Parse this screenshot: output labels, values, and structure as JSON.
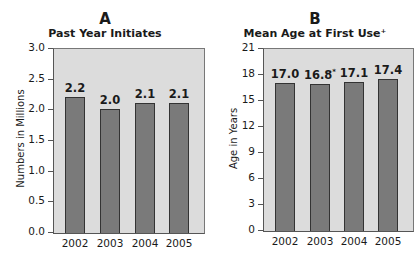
{
  "panels": [
    {
      "letter": "A",
      "title": "Past Year Initiates",
      "ylabel": "Numbers in Millions"
    },
    {
      "letter": "B",
      "title": "Mean Age at First Use⁺",
      "ylabel": "Age in Years"
    }
  ],
  "chart_data": [
    {
      "type": "bar",
      "title": "Past Year Initiates",
      "panel": "A",
      "xlabel": "",
      "ylabel": "Numbers in Millions",
      "categories": [
        "2002",
        "2003",
        "2004",
        "2005"
      ],
      "values": [
        2.2,
        2.0,
        2.1,
        2.1
      ],
      "value_labels": [
        "2.2",
        "2.0",
        "2.1",
        "2.1"
      ],
      "ylim": [
        0,
        3.0
      ],
      "yticks": [
        "0.0",
        "0.5",
        "1.0",
        "1.5",
        "2.0",
        "2.5",
        "3.0"
      ],
      "grid": false,
      "legend": null
    },
    {
      "type": "bar",
      "title": "Mean Age at First Use⁺",
      "panel": "B",
      "xlabel": "",
      "ylabel": "Age in Years",
      "categories": [
        "2002",
        "2003",
        "2004",
        "2005"
      ],
      "values": [
        17.0,
        16.8,
        17.1,
        17.4
      ],
      "value_labels": [
        "17.0",
        "16.8",
        "17.1",
        "17.4"
      ],
      "annotations": [
        {
          "category": "2003",
          "mark": "*"
        }
      ],
      "ylim": [
        0,
        21
      ],
      "yticks": [
        "0",
        "3",
        "6",
        "9",
        "12",
        "15",
        "18",
        "21"
      ],
      "grid": false,
      "legend": null
    }
  ],
  "colors": {
    "bar": "#7a7a7a",
    "plot_bg": "#dcdcdc",
    "bar_border": "#333333"
  }
}
